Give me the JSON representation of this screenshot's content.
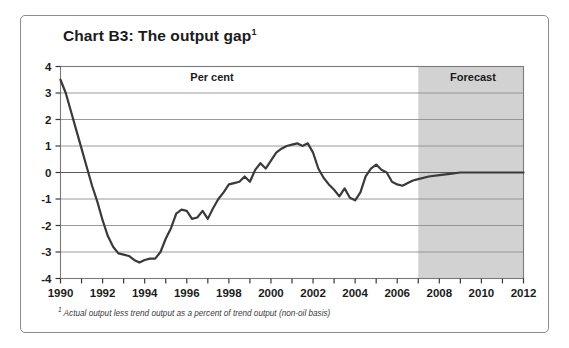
{
  "figure": {
    "title": "Chart B3: The output gap",
    "title_footnote_mark": "1",
    "footnote_mark": "1",
    "footnote": "Actual output less trend output as a percent of trend output (non-oil basis)",
    "frame_color": "#8c8c8c",
    "background_color": "#ffffff"
  },
  "chart_data": {
    "type": "line",
    "title": "Chart B3: The output gap",
    "subtitle": "",
    "xlabel": "",
    "ylabel": "Per cent",
    "units": "Per cent",
    "xlim": [
      1990,
      2012
    ],
    "ylim": [
      -4,
      4
    ],
    "yticks": [
      -4,
      -3,
      -2,
      -1,
      0,
      1,
      2,
      3,
      4
    ],
    "ytick_labels": [
      "-4",
      "-3",
      "-2",
      "-1",
      "0",
      "1",
      "2",
      "3",
      "4"
    ],
    "xticks": [
      1990,
      1991,
      1992,
      1993,
      1994,
      1995,
      1996,
      1997,
      1998,
      1999,
      2000,
      2001,
      2002,
      2003,
      2004,
      2005,
      2006,
      2007,
      2008,
      2009,
      2010,
      2011,
      2012
    ],
    "xtick_labels": [
      "1990",
      "",
      "1992",
      "",
      "1994",
      "",
      "1996",
      "",
      "1998",
      "",
      "2000",
      "",
      "2002",
      "",
      "2004",
      "",
      "2006",
      "",
      "2008",
      "",
      "2010",
      "",
      "2012"
    ],
    "xtick_labels_shown": [
      "1990",
      "1992",
      "1994",
      "1996",
      "1998",
      "2000",
      "2002",
      "2004",
      "2006",
      "2008",
      "2010",
      "2012"
    ],
    "grid": true,
    "grid_axis": "y",
    "legend": false,
    "line_color": "#3a3a3a",
    "line_width": 2.2,
    "zero_line": 0,
    "regions": [
      {
        "name": "Per cent",
        "label": "Per cent",
        "x_start": 1990,
        "x_end": 2007,
        "shaded": false,
        "fill": "#ffffff"
      },
      {
        "name": "Forecast",
        "label": "Forecast",
        "x_start": 2007,
        "x_end": 2012,
        "shaded": true,
        "fill": "#d2d2d2"
      }
    ],
    "series": [
      {
        "name": "Output gap",
        "x": [
          1990.0,
          1990.25,
          1990.5,
          1990.75,
          1991.0,
          1991.25,
          1991.5,
          1991.75,
          1992.0,
          1992.25,
          1992.5,
          1992.75,
          1993.0,
          1993.25,
          1993.5,
          1993.75,
          1994.0,
          1994.25,
          1994.5,
          1994.75,
          1995.0,
          1995.25,
          1995.5,
          1995.75,
          1996.0,
          1996.25,
          1996.5,
          1996.75,
          1997.0,
          1997.25,
          1997.5,
          1997.75,
          1998.0,
          1998.25,
          1998.5,
          1998.75,
          1999.0,
          1999.25,
          1999.5,
          1999.75,
          2000.0,
          2000.25,
          2000.5,
          2000.75,
          2001.0,
          2001.25,
          2001.5,
          2001.75,
          2002.0,
          2002.25,
          2002.5,
          2002.75,
          2003.0,
          2003.25,
          2003.5,
          2003.75,
          2004.0,
          2004.25,
          2004.5,
          2004.75,
          2005.0,
          2005.25,
          2005.5,
          2005.75,
          2006.0,
          2006.25,
          2006.5,
          2006.75,
          2007.0,
          2007.5,
          2008.0,
          2008.5,
          2009.0,
          2009.5,
          2010.0,
          2010.5,
          2011.0,
          2011.5,
          2012.0
        ],
        "y": [
          3.5,
          3.0,
          2.3,
          1.6,
          0.9,
          0.2,
          -0.5,
          -1.1,
          -1.8,
          -2.4,
          -2.8,
          -3.05,
          -3.1,
          -3.15,
          -3.3,
          -3.4,
          -3.3,
          -3.25,
          -3.25,
          -3.0,
          -2.5,
          -2.1,
          -1.55,
          -1.4,
          -1.45,
          -1.75,
          -1.7,
          -1.45,
          -1.75,
          -1.35,
          -1.0,
          -0.75,
          -0.45,
          -0.4,
          -0.35,
          -0.15,
          -0.35,
          0.1,
          0.35,
          0.15,
          0.45,
          0.75,
          0.9,
          1.0,
          1.05,
          1.1,
          1.0,
          1.1,
          0.75,
          0.15,
          -0.2,
          -0.45,
          -0.65,
          -0.9,
          -0.6,
          -0.95,
          -1.05,
          -0.75,
          -0.15,
          0.15,
          0.3,
          0.1,
          0.0,
          -0.35,
          -0.45,
          -0.5,
          -0.4,
          -0.3,
          -0.25,
          -0.15,
          -0.1,
          -0.05,
          0.0,
          0.0,
          0.0,
          0.0,
          0.0,
          0.0,
          0.0
        ]
      }
    ],
    "annotations": [
      {
        "text": "Per cent",
        "x": 1997.2,
        "y": 3.45
      },
      {
        "text": "Forecast",
        "x": 2009.6,
        "y": 3.45
      }
    ]
  }
}
